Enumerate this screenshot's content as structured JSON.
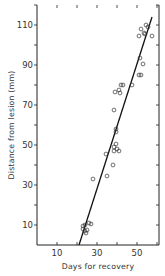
{
  "chart_data": {
    "type": "scatter",
    "title": "",
    "xlabel": "Days for recovery",
    "ylabel": "Distance from lesion (mm)",
    "xlim": [
      0,
      61
    ],
    "ylim": [
      0,
      120
    ],
    "x_ticks": [
      10,
      20,
      30,
      40,
      50,
      60
    ],
    "x_tick_labels": [
      "10",
      "",
      "30",
      "",
      "50",
      ""
    ],
    "y_ticks": [
      10,
      20,
      30,
      40,
      50,
      60,
      70,
      80,
      90,
      100,
      110,
      120
    ],
    "y_tick_labels": [
      "10",
      "",
      "30",
      "",
      "50",
      "",
      "70",
      "",
      "90",
      "",
      "110",
      ""
    ],
    "grid": false,
    "legend": null,
    "series": [
      {
        "name": "observations",
        "marker": "open-circle",
        "points": [
          {
            "x": 23,
            "y": 9.5
          },
          {
            "x": 24,
            "y": 10
          },
          {
            "x": 23,
            "y": 8
          },
          {
            "x": 24.5,
            "y": 6
          },
          {
            "x": 25,
            "y": 7.5
          },
          {
            "x": 26,
            "y": 11
          },
          {
            "x": 27,
            "y": 10.5
          },
          {
            "x": 24,
            "y": 7
          },
          {
            "x": 28,
            "y": 33
          },
          {
            "x": 34.5,
            "y": 45.5
          },
          {
            "x": 35,
            "y": 34.5
          },
          {
            "x": 38,
            "y": 40
          },
          {
            "x": 38.5,
            "y": 47
          },
          {
            "x": 38.5,
            "y": 49
          },
          {
            "x": 39.5,
            "y": 50.5
          },
          {
            "x": 40,
            "y": 48
          },
          {
            "x": 41,
            "y": 47
          },
          {
            "x": 39.5,
            "y": 56.5
          },
          {
            "x": 39.5,
            "y": 58
          },
          {
            "x": 38.5,
            "y": 67.5
          },
          {
            "x": 39,
            "y": 76.5
          },
          {
            "x": 41,
            "y": 77.5
          },
          {
            "x": 41.5,
            "y": 76
          },
          {
            "x": 42,
            "y": 80
          },
          {
            "x": 43,
            "y": 80
          },
          {
            "x": 47.5,
            "y": 80
          },
          {
            "x": 51,
            "y": 85
          },
          {
            "x": 52,
            "y": 85
          },
          {
            "x": 51.5,
            "y": 93.5
          },
          {
            "x": 53,
            "y": 90.5
          },
          {
            "x": 51,
            "y": 104.5
          },
          {
            "x": 52,
            "y": 108
          },
          {
            "x": 53.5,
            "y": 106
          },
          {
            "x": 54.5,
            "y": 110
          },
          {
            "x": 55.5,
            "y": 109
          },
          {
            "x": 57.5,
            "y": 104.5
          },
          {
            "x": 54,
            "y": 105.5
          }
        ]
      },
      {
        "name": "regression line",
        "type": "line",
        "points": [
          {
            "x": 21,
            "y": 0
          },
          {
            "x": 57.5,
            "y": 114
          }
        ]
      }
    ]
  }
}
